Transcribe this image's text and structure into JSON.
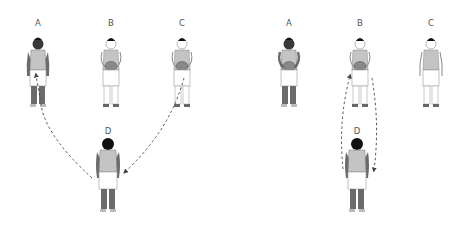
{
  "diagram": {
    "panels": [
      {
        "id": "left",
        "players": [
          {
            "label": "A",
            "x": 38,
            "y": 19,
            "skin": "dark",
            "holds_ball": false,
            "facing": "front"
          },
          {
            "label": "B",
            "x": 111,
            "y": 19,
            "skin": "light",
            "holds_ball": true,
            "facing": "front"
          },
          {
            "label": "C",
            "x": 182,
            "y": 19,
            "skin": "light",
            "holds_ball": true,
            "facing": "front"
          },
          {
            "label": "D",
            "x": 108,
            "y": 128,
            "skin": "dark",
            "holds_ball": false,
            "facing": "back"
          }
        ],
        "arrows": [
          "D to A (pass, dashed)",
          "C to D (pass, dashed)"
        ]
      },
      {
        "id": "right",
        "players": [
          {
            "label": "A",
            "x": 289,
            "y": 19,
            "skin": "dark",
            "holds_ball": true,
            "facing": "front"
          },
          {
            "label": "B",
            "x": 360,
            "y": 19,
            "skin": "light",
            "holds_ball": true,
            "facing": "front"
          },
          {
            "label": "C",
            "x": 431,
            "y": 19,
            "skin": "light",
            "holds_ball": false,
            "facing": "front"
          },
          {
            "label": "D",
            "x": 357,
            "y": 128,
            "skin": "dark",
            "holds_ball": false,
            "facing": "back"
          }
        ],
        "arrows": [
          "D to B (pass, dashed)",
          "B to D (pass, dashed)"
        ]
      }
    ],
    "colors": {
      "dark_skin": "#6b6b6b",
      "light_outline": "#8a8a8a",
      "shirt": "#c4c4c4",
      "hair": "#222222",
      "arrow": "#555555"
    }
  }
}
